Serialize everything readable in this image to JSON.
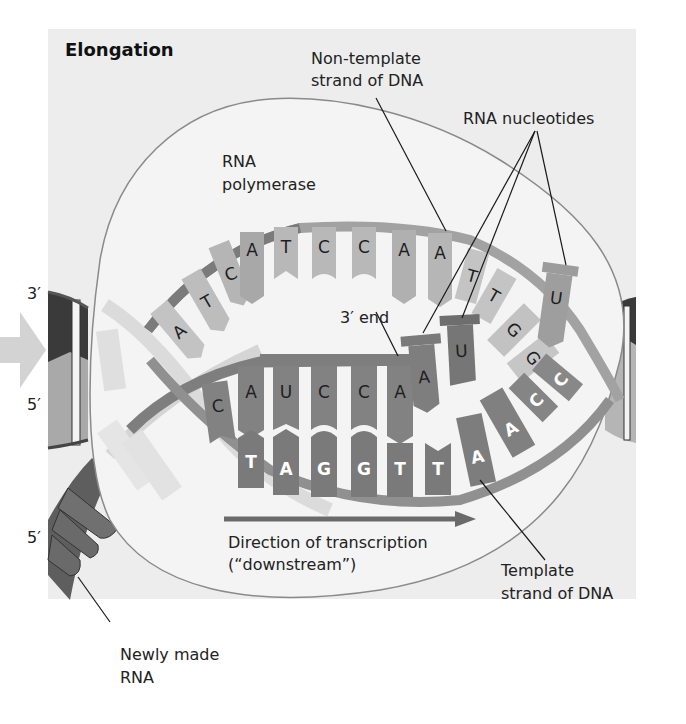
{
  "figure": {
    "title": "Elongation",
    "background_color": "#ededed",
    "labels": {
      "non_template_line1": "Non-template",
      "non_template_line2": "strand of DNA",
      "rna_nucleotides": "RNA nucleotides",
      "rna_polymerase_line1": "RNA",
      "rna_polymerase_line2": "polymerase",
      "three_prime_end": "3′ end",
      "direction_line1": "Direction of transcription",
      "direction_line2": "(“downstream”)",
      "template_line1": "Template",
      "template_line2": "strand of DNA",
      "newly_made_line1": "Newly made",
      "newly_made_line2": "RNA",
      "left_top_end": "3′",
      "left_mid_end": "5′",
      "left_bottom_end": "5′"
    },
    "non_template_bases": [
      "A",
      "T",
      "C",
      "A",
      "T",
      "C",
      "C",
      "A",
      "A",
      "T",
      "T",
      "G",
      "G"
    ],
    "rna_bases": [
      "C",
      "A",
      "U",
      "C",
      "C",
      "A"
    ],
    "incoming_nucleotides": [
      "A",
      "U",
      "U"
    ],
    "template_bases": [
      "T",
      "A",
      "G",
      "G",
      "T",
      "T",
      "A",
      "A",
      "C",
      "C"
    ],
    "colors": {
      "panel": "#ededed",
      "polymerase_fill": "#f3f3f3",
      "polymerase_outline": "#8a8a8a",
      "non_template_strand": "#b9b9b9",
      "template_strand": "#8c8c8c",
      "rna_strand": "#6f6f6f",
      "arrow": "#6a6a6a",
      "dark_dna": "#3c3c3c"
    }
  }
}
